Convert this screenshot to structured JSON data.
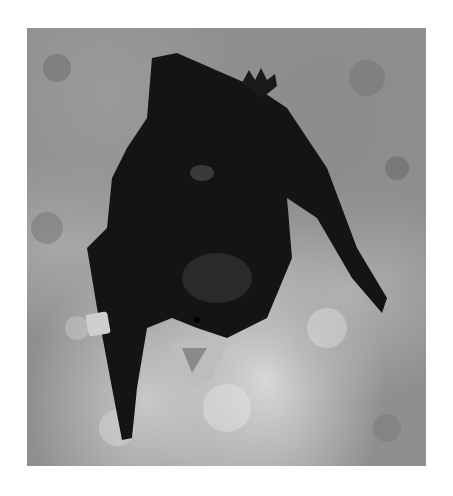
{
  "image": {
    "subject": "bat",
    "description": "Black-and-white photograph of a dark bat clinging to a rock surface, mouth open showing teeth, with a metal band on its left forearm",
    "colors": {
      "background": "#ffffff",
      "rock": "#8f8f8f",
      "bat": "#141414",
      "band": "#cfcfcf",
      "mouth": "#bdbdbd"
    }
  }
}
